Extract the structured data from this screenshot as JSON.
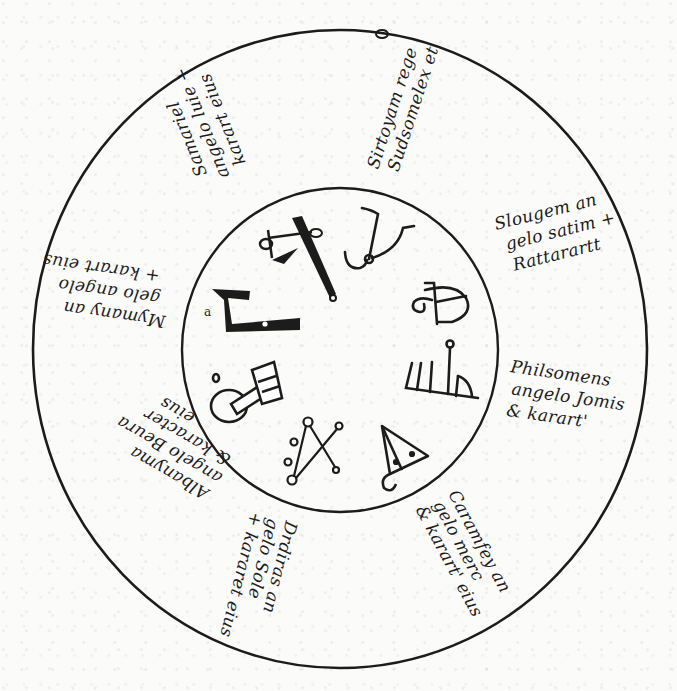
{
  "diagram": {
    "type": "magic-circle-manuscript",
    "outer_circle": {
      "cx": 340,
      "cy": 349,
      "rx": 307,
      "ry": 319
    },
    "inner_circle": {
      "cx": 340,
      "cy": 350,
      "rx": 158,
      "ry": 162
    },
    "ink_color": "#1c1c1c",
    "paper_color": "#fbfbfa",
    "inner_label": "a",
    "segments": [
      {
        "id": "top-right",
        "lines": [
          "Sirtoyam rege",
          "Sudsomelex et"
        ],
        "symbol": "hook-horns-sigil"
      },
      {
        "id": "right-upper",
        "lines": [
          "Slougem an",
          "gelo satim +",
          "Rattarartt"
        ],
        "symbol": "spiral-cross-sigil"
      },
      {
        "id": "right",
        "lines": [
          "Philsomens",
          "angelo Jomis",
          "& karart'"
        ],
        "symbol": "comb-sigil"
      },
      {
        "id": "bottom-right",
        "lines": [
          "Caramfey an",
          "gelo merc",
          "& karart' eius"
        ],
        "symbol": "triangle-sigil"
      },
      {
        "id": "bottom",
        "lines": [
          "Drdiras an",
          "gelo Sole",
          "+ kararet eius"
        ],
        "symbol": "crossed-circles-sigil"
      },
      {
        "id": "left-lower",
        "lines": [
          "Albanyma",
          "angelo Beura",
          "& karacter",
          "eius"
        ],
        "symbol": "key-circle-sigil"
      },
      {
        "id": "left",
        "lines": [
          "Mymany an",
          "gelo angelo",
          "+ karart eius"
        ],
        "symbol": "block-hook-sigil"
      },
      {
        "id": "top-left",
        "lines": [
          "Samariel",
          "angelo luie +",
          "karart eius"
        ],
        "symbol": "cross-blade-sigil"
      }
    ]
  }
}
